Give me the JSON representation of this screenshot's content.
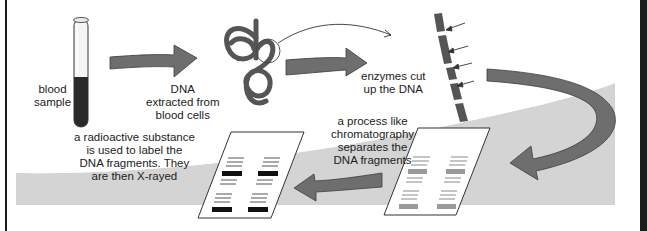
{
  "colors": {
    "background": "#ffffff",
    "band": "#d4d4d4",
    "arrow": "#6e6e6e",
    "arrow_outline": "#3e3e3e",
    "dna": "#555555",
    "blood": "#2a2a2a",
    "xray_band": "#111111",
    "chromatography_band": "#9a9a9a",
    "frame": "#1c1c1c"
  },
  "steps": [
    {
      "id": "blood-sample",
      "label_lines": [
        "blood",
        "sample"
      ],
      "icon": "test-tube-icon"
    },
    {
      "id": "dna-extracted",
      "label_lines": [
        "DNA",
        "extracted from",
        "blood cells"
      ],
      "icon": "dna-coil-icon"
    },
    {
      "id": "enzymes-cut",
      "label_lines": [
        "enzymes cut",
        "up the DNA"
      ],
      "icon": "cut-dna-strand-icon"
    },
    {
      "id": "chromatography",
      "label_lines": [
        "a process like",
        "chromatography",
        "separates the",
        "DNA fragments"
      ],
      "icon": "chromatography-gel-icon"
    },
    {
      "id": "radioactive-xray",
      "label_lines": [
        "a radioactive substance",
        "is used to label the",
        "DNA fragments. They",
        "are then X-rayed"
      ],
      "icon": "xray-film-icon"
    }
  ],
  "cut_marks": 4
}
